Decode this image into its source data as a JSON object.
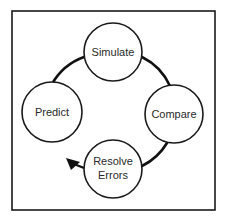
{
  "diagram": {
    "type": "cycle",
    "frame": {
      "x": 12,
      "y": 11,
      "width": 203,
      "height": 199,
      "stroke": "#1a1a1a"
    },
    "ring": {
      "cx": 113,
      "cy": 112,
      "r": 60,
      "stroke": "#111111"
    },
    "nodes": [
      {
        "id": "simulate",
        "lines": [
          "Simulate"
        ],
        "cx": 113,
        "cy": 52,
        "r": 29
      },
      {
        "id": "compare",
        "lines": [
          "Compare"
        ],
        "cx": 174,
        "cy": 114,
        "r": 29
      },
      {
        "id": "resolve-errors",
        "lines": [
          "Resolve",
          "Errors"
        ],
        "cx": 113,
        "cy": 169,
        "r": 29
      },
      {
        "id": "predict",
        "lines": [
          "Predict"
        ],
        "cx": 52,
        "cy": 112,
        "r": 30
      }
    ],
    "flow": [
      "Predict",
      "Simulate",
      "Compare",
      "Resolve Errors"
    ],
    "arrow": {
      "tip_x": 67,
      "tip_y": 159,
      "direction": "up-left"
    }
  }
}
